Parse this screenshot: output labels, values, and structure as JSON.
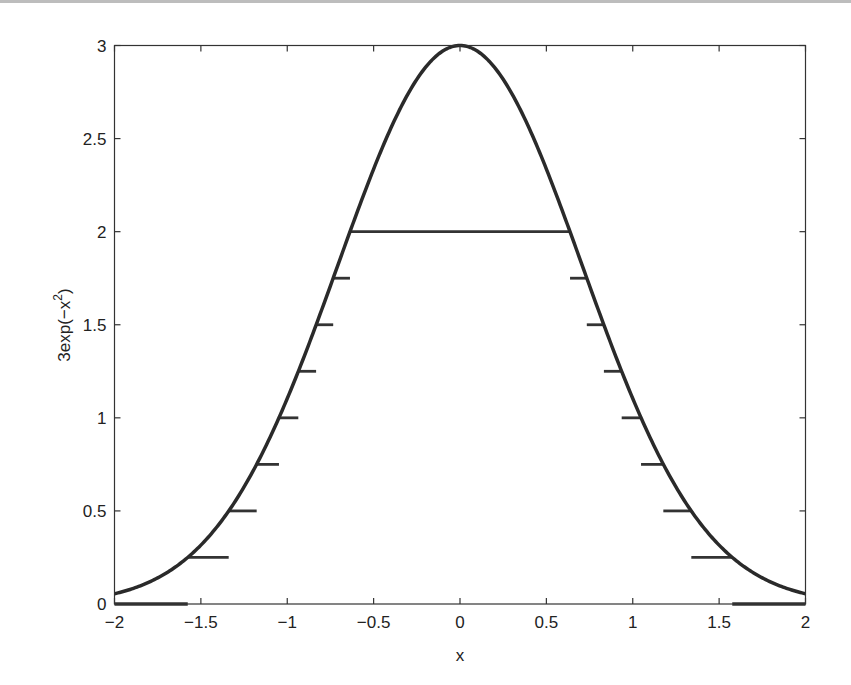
{
  "chart_data": {
    "type": "line",
    "title": "",
    "xlabel": "x",
    "ylabel": "3exp(-x^2)",
    "ylabel_base": "3exp(−x",
    "ylabel_sup": "2",
    "ylabel_tail": ")",
    "xlim": [
      -2,
      2
    ],
    "ylim": [
      0,
      3
    ],
    "grid": false,
    "xticks": [
      -2,
      -1.5,
      -1,
      -0.5,
      0,
      0.5,
      1,
      1.5,
      2
    ],
    "xtick_labels": [
      "−2",
      "−1.5",
      "−1",
      "−0.5",
      "0",
      "0.5",
      "1",
      "1.5",
      "2"
    ],
    "yticks": [
      0,
      0.5,
      1,
      1.5,
      2,
      2.5,
      3
    ],
    "ytick_labels": [
      "0",
      "0.5",
      "1",
      "1.5",
      "2",
      "2.5",
      "3"
    ],
    "series": [
      {
        "name": "3exp(-x^2)",
        "function": "3*exp(-x^2)",
        "x_range": [
          -2,
          2
        ]
      },
      {
        "name": "horizontal level segments",
        "segments": [
          {
            "y": 0,
            "x": [
              -2,
              -1.576
            ]
          },
          {
            "y": 0.25,
            "x": [
              -1.576,
              -1.339
            ]
          },
          {
            "y": 0.5,
            "x": [
              -1.339,
              -1.177
            ]
          },
          {
            "y": 0.75,
            "x": [
              -1.177,
              -1.048
            ]
          },
          {
            "y": 1.0,
            "x": [
              -1.048,
              -0.936
            ]
          },
          {
            "y": 1.25,
            "x": [
              -0.936,
              -0.833
            ]
          },
          {
            "y": 1.5,
            "x": [
              -0.833,
              -0.734
            ]
          },
          {
            "y": 1.75,
            "x": [
              -0.734,
              -0.637
            ]
          },
          {
            "y": 2.0,
            "x": [
              -0.637,
              0.637
            ]
          },
          {
            "y": 1.75,
            "x": [
              0.637,
              0.734
            ]
          },
          {
            "y": 1.5,
            "x": [
              0.734,
              0.833
            ]
          },
          {
            "y": 1.25,
            "x": [
              0.833,
              0.936
            ]
          },
          {
            "y": 1.0,
            "x": [
              0.936,
              1.048
            ]
          },
          {
            "y": 0.75,
            "x": [
              1.048,
              1.177
            ]
          },
          {
            "y": 0.5,
            "x": [
              1.177,
              1.339
            ]
          },
          {
            "y": 0.25,
            "x": [
              1.339,
              1.576
            ]
          },
          {
            "y": 0,
            "x": [
              1.576,
              2
            ]
          }
        ]
      }
    ]
  }
}
